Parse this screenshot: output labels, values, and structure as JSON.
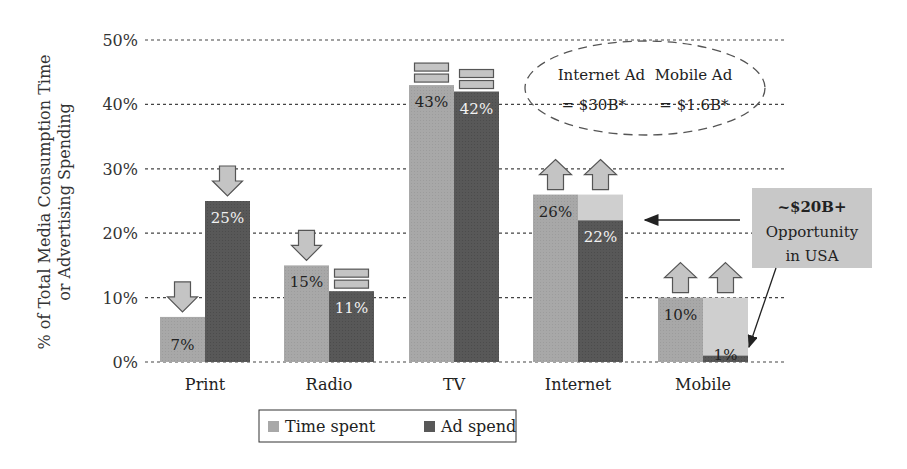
{
  "chart_data": {
    "type": "bar",
    "title": "",
    "xlabel": "",
    "ylabel": "% of Total Media Consumption Time or Advertising Spending",
    "ylabel_lines": [
      "% of Total Media Consumption Time",
      "or Advertising Spending"
    ],
    "ylim": [
      0,
      50
    ],
    "yticks": [
      0,
      10,
      20,
      30,
      40,
      50
    ],
    "ytick_labels": [
      "0%",
      "10%",
      "20%",
      "30%",
      "40%",
      "50%"
    ],
    "grid": true,
    "categories": [
      "Print",
      "Radio",
      "TV",
      "Internet",
      "Mobile"
    ],
    "series": [
      {
        "name": "Time spent",
        "color": "#a8a8a8",
        "values": [
          7,
          15,
          43,
          26,
          10
        ]
      },
      {
        "name": "Ad spend",
        "color": "#585858",
        "values": [
          25,
          11,
          42,
          22,
          1
        ]
      }
    ],
    "data_labels": {
      "Time spent": [
        "7%",
        "15%",
        "43%",
        "26%",
        "10%"
      ],
      "Ad spend": [
        "25%",
        "11%",
        "42%",
        "22%",
        "1%"
      ]
    },
    "gap_fill": {
      "color": "#cfcfcf",
      "description": "Light shaded gap above Ad spend up to Time spent level",
      "categories": [
        "Internet",
        "Mobile"
      ]
    },
    "trend_markers": {
      "Print": [
        "down",
        "down"
      ],
      "Radio": [
        "down",
        "flat"
      ],
      "TV": [
        "flat",
        "flat"
      ],
      "Internet": [
        "up",
        "up"
      ],
      "Mobile": [
        "up",
        "up"
      ]
    },
    "legend": {
      "placement": "bottom",
      "entries": [
        "Time spent",
        "Ad spend"
      ]
    },
    "annotations": {
      "ellipse": {
        "line1": "Internet Ad  Mobile Ad",
        "line2": "= $30B*       = $1.6B*"
      },
      "opportunity_box": {
        "line1": "~$20B+",
        "line2": "Opportunity",
        "line3": "in USA",
        "arrows_to": [
          "Internet",
          "Mobile"
        ]
      }
    }
  }
}
